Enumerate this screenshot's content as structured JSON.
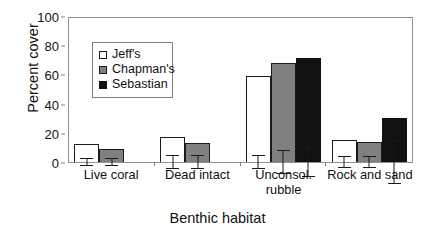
{
  "chart_data": {
    "type": "bar",
    "title": "",
    "xlabel": "Benthic habitat",
    "ylabel": "Percent cover",
    "ylim": [
      0,
      100
    ],
    "yticks": [
      0,
      20,
      40,
      60,
      80,
      100
    ],
    "grid": false,
    "legend_position": "upper-left-inside",
    "categories": [
      "Live coral",
      "Dead intact",
      "Unconsol. rubble",
      "Rock and sand"
    ],
    "category_lines": [
      [
        "Live coral"
      ],
      [
        "Dead intact"
      ],
      [
        "Unconsol.",
        "rubble"
      ],
      [
        "Rock and sand"
      ]
    ],
    "series": [
      {
        "name": "Jeff's",
        "color": "#ffffff",
        "values": [
          12,
          17,
          59,
          15
        ],
        "errors": [
          3,
          5,
          5,
          4
        ]
      },
      {
        "name": "Chapman's",
        "color": "#808080",
        "values": [
          9,
          13,
          68,
          14
        ],
        "errors": [
          3,
          5,
          8,
          4
        ]
      },
      {
        "name": "Sebastian",
        "color": "#111111",
        "values": [
          null,
          null,
          71,
          30
        ],
        "errors": [
          null,
          null,
          10,
          15
        ]
      }
    ]
  },
  "axes": {
    "y_title": "Percent cover",
    "x_title": "Benthic habitat",
    "y_tick_labels": [
      "100",
      "80",
      "60",
      "40",
      "20",
      "0"
    ]
  },
  "legend": {
    "items": [
      {
        "label": "Jeff's",
        "series_key": "jeffs"
      },
      {
        "label": "Chapman's",
        "series_key": "chapmans"
      },
      {
        "label": "Sebastian",
        "series_key": "sebastian"
      }
    ]
  }
}
